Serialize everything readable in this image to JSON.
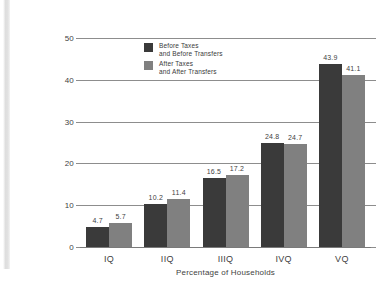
{
  "chart_data": {
    "type": "bar",
    "title": "",
    "subtitle": "",
    "xlabel": "Percentage of Households",
    "ylabel": "",
    "categories": [
      "IQ",
      "IIQ",
      "IIIQ",
      "IVQ",
      "VQ"
    ],
    "series": [
      {
        "name": "Before Taxes\nand Before Transfers",
        "color": "#3a3a3a",
        "values": [
          4.7,
          10.2,
          16.5,
          24.8,
          43.9
        ],
        "labels": [
          "4.7",
          "10.2",
          "16.5",
          "24.8",
          "43.9"
        ]
      },
      {
        "name": "After Taxes\nand After Transfers",
        "color": "#808080",
        "values": [
          5.7,
          11.4,
          17.2,
          24.7,
          41.1
        ],
        "labels": [
          "5.7",
          "11.4",
          "17.2",
          "24.7",
          "41.1"
        ]
      }
    ],
    "ylim": [
      0,
      50
    ],
    "yticks": [
      0,
      10,
      20,
      30,
      40,
      50
    ],
    "ytick_labels": [
      "0",
      "10",
      "20",
      "30",
      "40",
      "50"
    ],
    "grid": true,
    "legend_position": "top-left-inside"
  },
  "axis": {
    "y_labels": [
      "50",
      "40",
      "30",
      "20",
      "10",
      "0"
    ],
    "x_labels": [
      "IQ",
      "IIQ",
      "IIIQ",
      "IVQ",
      "VQ"
    ],
    "x_title": "Percentage of Households"
  },
  "legend": {
    "entries": [
      {
        "label": "Before Taxes\nand Before Transfers",
        "color": "#3a3a3a"
      },
      {
        "label": "After Taxes\nand After Transfers",
        "color": "#808080"
      }
    ]
  },
  "colors": {
    "series_before": "#3a3a3a",
    "series_after": "#808080",
    "gridline": "#8d8d8d",
    "text": "#3f3f3f",
    "background": "#ffffff"
  }
}
